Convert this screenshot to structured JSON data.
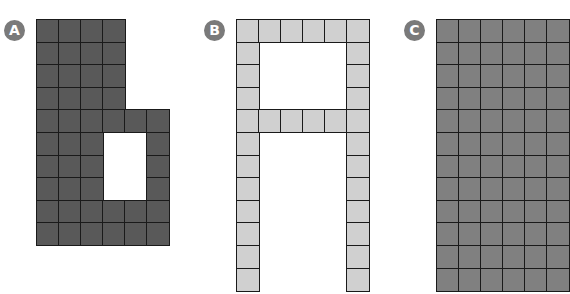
{
  "figure": {
    "cell_width": 22,
    "cell_height": 22.6,
    "shapes": [
      {
        "label": "A",
        "badge_x": 4,
        "badge_y": 20,
        "x": 36,
        "y": 19,
        "cols": 6,
        "rows": 10,
        "fill": "#595959",
        "grid": [
          "XXXX..",
          "XXXX..",
          "XXXX..",
          "XXXX..",
          "XXXXXX",
          "XXX..X",
          "XXX..X",
          "XXX..X",
          "XXXXXX",
          "XXXXXX"
        ],
        "filled_cells": 50
      },
      {
        "label": "B",
        "badge_x": 204,
        "badge_y": 20,
        "x": 236,
        "y": 19,
        "cols": 6,
        "rows": 12,
        "fill": "#d0d0d0",
        "grid": [
          "XXXXXX",
          "X....X",
          "X....X",
          "X....X",
          "XXXXXX",
          "X....X",
          "X....X",
          "X....X",
          "X....X",
          "X....X",
          "X....X",
          "X....X"
        ],
        "filled_cells": 32
      },
      {
        "label": "C",
        "badge_x": 404,
        "badge_y": 20,
        "x": 436,
        "y": 19,
        "cols": 6,
        "rows": 12,
        "fill": "#808080",
        "grid": [
          "XXXXXX",
          "XXXXXX",
          "XXXXXX",
          "XXXXXX",
          "XXXXXX",
          "XXXXXX",
          "XXXXXX",
          "XXXXXX",
          "XXXXXX",
          "XXXXXX",
          "XXXXXX",
          "XXXXXX"
        ],
        "filled_cells": 72
      }
    ]
  }
}
